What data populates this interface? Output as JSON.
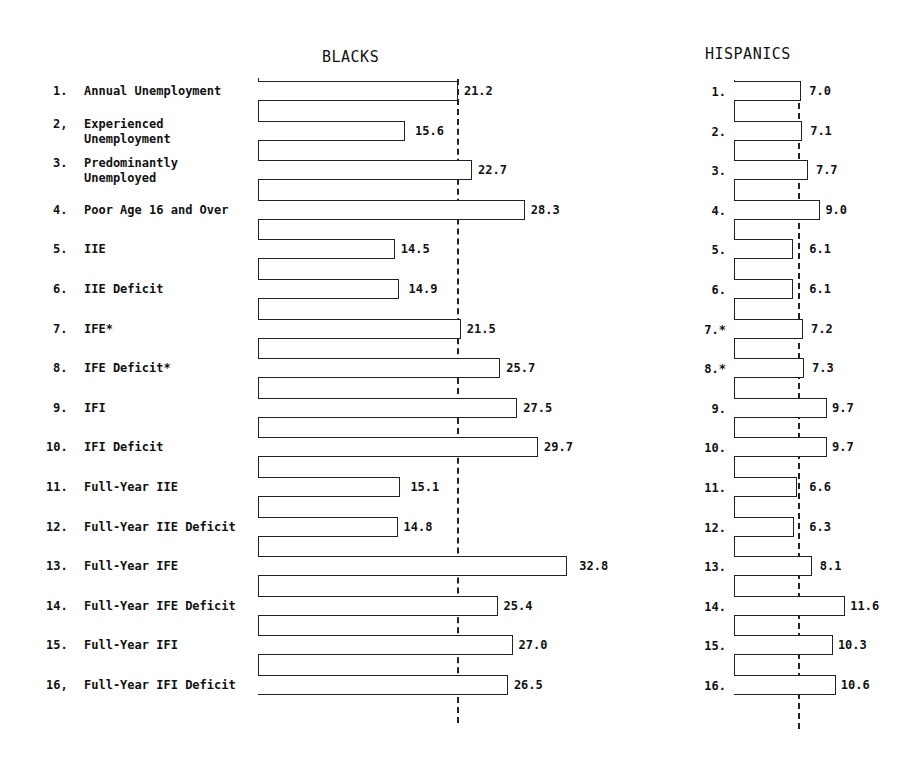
{
  "chart_data": [
    {
      "type": "bar",
      "orientation": "horizontal",
      "title": "BLACKS",
      "categories": [
        "1. Annual Unemployment",
        "2. Experienced Unemployment",
        "3. Predominantly Unemployed",
        "4. Poor Age 16 and Over",
        "5. IIE",
        "6. IIE Deficit",
        "7. IFE*",
        "8. IFE Deficit*",
        "9. IFI",
        "10. IFI Deficit",
        "11. Full-Year IIE",
        "12. Full-Year IIE Deficit",
        "13. Full-Year IFE",
        "14. Full-Year IFE Deficit",
        "15. Full-Year IFI",
        "16. Full-Year IFI Deficit"
      ],
      "values": [
        21.2,
        15.6,
        22.7,
        28.3,
        14.5,
        14.9,
        21.5,
        25.7,
        27.5,
        29.7,
        15.1,
        14.8,
        32.8,
        25.4,
        27.0,
        26.5
      ],
      "value_labels": [
        "21.2",
        "15.6",
        "22.7",
        "28.3",
        "14.5",
        "14.9",
        "21.5",
        "25.7",
        "27.5",
        "29.7",
        "15.1",
        "14.8",
        "32.8",
        "25.4",
        "27.0",
        "26.5"
      ],
      "reference_line": 21.2,
      "reference_line_style": "dashed vertical",
      "xlabel": "",
      "ylabel": "",
      "grid": false,
      "legend": null
    },
    {
      "type": "bar",
      "orientation": "horizontal",
      "title": "HISPANICS",
      "categories": [
        "1.",
        "2.",
        "3.",
        "4.",
        "5.",
        "6.",
        "7.*",
        "8.*",
        "9.",
        "10.",
        "11.",
        "12.",
        "13.",
        "14.",
        "15.",
        "16."
      ],
      "values": [
        7.0,
        7.1,
        7.7,
        9.0,
        6.1,
        6.1,
        7.2,
        7.3,
        9.7,
        9.7,
        6.6,
        6.3,
        8.1,
        11.6,
        10.3,
        10.6
      ],
      "value_labels": [
        "7.0",
        "7.1",
        "7.7",
        "9.0",
        "6.1",
        "6.1",
        "7.2",
        "7.3",
        "9.7",
        "9.7",
        "6.6",
        "6.3",
        "8.1",
        "11.6",
        "10.3",
        "10.6"
      ],
      "reference_line": 7.0,
      "reference_line_style": "dashed vertical",
      "xlabel": "",
      "ylabel": "",
      "grid": false,
      "legend": null
    }
  ],
  "blacks": {
    "title": "BLACKS",
    "rows": [
      {
        "num": "1.",
        "label": [
          "Annual Unemployment"
        ],
        "value": "21.2"
      },
      {
        "num": "2,",
        "label": [
          "Experienced",
          "Unemployment"
        ],
        "value": "15.6"
      },
      {
        "num": "3.",
        "label": [
          "Predominantly",
          "Unemployed"
        ],
        "value": "22.7"
      },
      {
        "num": "4.",
        "label": [
          "Poor Age 16 and Over"
        ],
        "value": "28.3"
      },
      {
        "num": "5.",
        "label": [
          "IIE"
        ],
        "value": "14.5"
      },
      {
        "num": "6.",
        "label": [
          "IIE Deficit"
        ],
        "value": "14.9"
      },
      {
        "num": "7.",
        "label": [
          "IFE*"
        ],
        "value": "21.5"
      },
      {
        "num": "8.",
        "label": [
          "IFE Deficit*"
        ],
        "value": "25.7"
      },
      {
        "num": "9.",
        "label": [
          "IFI"
        ],
        "value": "27.5"
      },
      {
        "num": "10.",
        "label": [
          "IFI Deficit"
        ],
        "value": "29.7"
      },
      {
        "num": "11.",
        "label": [
          "Full-Year IIE"
        ],
        "value": "15.1"
      },
      {
        "num": "12.",
        "label": [
          "Full-Year IIE Deficit"
        ],
        "value": "14.8"
      },
      {
        "num": "13.",
        "label": [
          "Full-Year IFE"
        ],
        "value": "32.8"
      },
      {
        "num": "14.",
        "label": [
          "Full-Year IFE Deficit"
        ],
        "value": "25.4"
      },
      {
        "num": "15.",
        "label": [
          "Full-Year IFI"
        ],
        "value": "27.0"
      },
      {
        "num": "16,",
        "label": [
          "Full-Year IFI Deficit"
        ],
        "value": "26.5"
      }
    ]
  },
  "hispanics": {
    "title": "HISPANICS",
    "rows": [
      {
        "num": "1.",
        "value": "7.0"
      },
      {
        "num": "2.",
        "value": "7.1"
      },
      {
        "num": "3.",
        "value": "7.7"
      },
      {
        "num": "4.",
        "value": "9.0"
      },
      {
        "num": "5.",
        "value": "6.1"
      },
      {
        "num": "6.",
        "value": "6.1"
      },
      {
        "num": "7.*",
        "value": "7.2"
      },
      {
        "num": "8.*",
        "value": "7.3"
      },
      {
        "num": "9.",
        "value": "9.7"
      },
      {
        "num": "10.",
        "value": "9.7"
      },
      {
        "num": "11.",
        "value": "6.6"
      },
      {
        "num": "12.",
        "value": "6.3"
      },
      {
        "num": "13.",
        "value": "8.1"
      },
      {
        "num": "14.",
        "value": "11.6"
      },
      {
        "num": "15.",
        "value": "10.3"
      },
      {
        "num": "16.",
        "value": "10.6"
      }
    ]
  }
}
